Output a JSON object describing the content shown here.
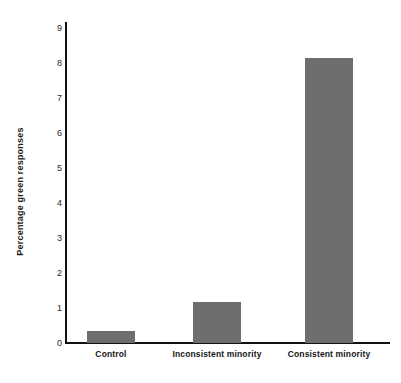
{
  "chart_data": {
    "type": "bar",
    "title": "",
    "xlabel": "",
    "ylabel": "Percentage green responses",
    "categories": [
      "Control",
      "Inconsistent minority",
      "Consistent minority"
    ],
    "values": [
      0.35,
      1.17,
      8.13
    ],
    "ylim": [
      0,
      9
    ],
    "yticks": [
      0,
      1,
      2,
      3,
      4,
      5,
      6,
      7,
      8,
      9
    ],
    "ytick_labels": [
      "0",
      "1",
      "2",
      "3",
      "4",
      "5",
      "6",
      "7",
      "8",
      "9"
    ],
    "grid": false,
    "legend": null,
    "bar_color": "#6e6e6e",
    "axis_color": "#111111",
    "background_color": "#ffffff"
  }
}
